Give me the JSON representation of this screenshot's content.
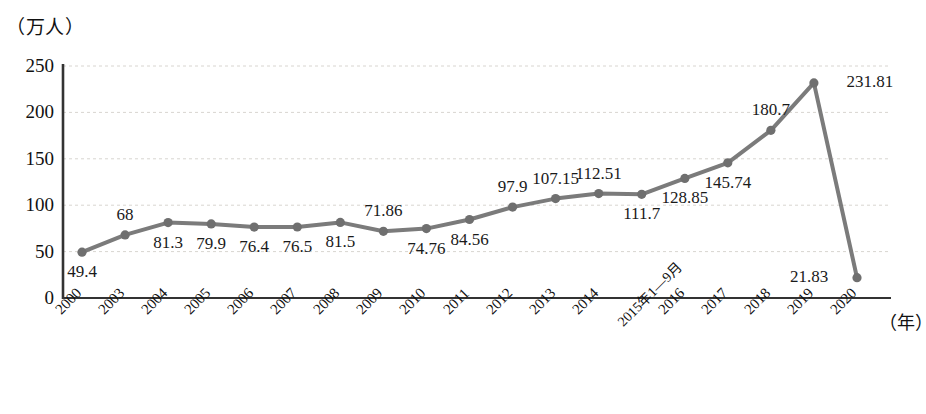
{
  "chart_data": {
    "type": "line",
    "title": "",
    "unit_label": "（万人）",
    "xlabel": "（年）",
    "ylabel": "",
    "ylim": [
      0,
      250
    ],
    "yticks": [
      0,
      50,
      100,
      150,
      200,
      250
    ],
    "grid": true,
    "legend": null,
    "line_color": "#7b7b7b",
    "marker_color": "#6f6f6f",
    "categories": [
      "2000",
      "2003",
      "2004",
      "2005",
      "2006",
      "2007",
      "2008",
      "2009",
      "2010",
      "2011",
      "2012",
      "2013",
      "2014",
      "2015年1—9月",
      "2016",
      "2017",
      "2018",
      "2019",
      "2020"
    ],
    "values": [
      49.4,
      68,
      81.3,
      79.9,
      76.4,
      76.5,
      81.5,
      71.86,
      74.76,
      84.56,
      97.9,
      107.15,
      112.51,
      111.7,
      128.85,
      145.74,
      180.7,
      231.81,
      21.83
    ],
    "point_labels": [
      "49.4",
      "68",
      "81.3",
      "79.9",
      "76.4",
      "76.5",
      "81.5",
      "71.86",
      "74.76",
      "84.56",
      "97.9",
      "107.15",
      "112.51",
      "111.7",
      "128.85",
      "145.74",
      "180.7",
      "231.81",
      "21.83"
    ],
    "label_positions": [
      "below",
      "above",
      "below",
      "below",
      "below",
      "below",
      "below",
      "above",
      "below",
      "below",
      "above",
      "above",
      "above",
      "below",
      "below",
      "below",
      "above",
      "right",
      "left"
    ]
  }
}
